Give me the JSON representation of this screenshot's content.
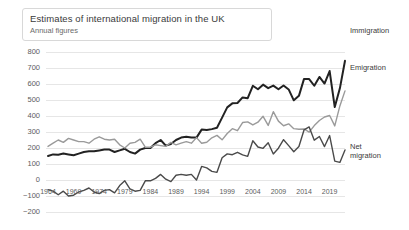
{
  "header": {
    "title": "Estimates of international migration in the UK",
    "subtitle": "Annual figures"
  },
  "chart_data": {
    "type": "line",
    "title": "Estimates of international migration in the UK",
    "subtitle": "Annual figures",
    "xlabel": "",
    "ylabel": "",
    "units": "thousands",
    "grid": true,
    "legend_position": "right-inline",
    "xlim": [
      1964,
      2022
    ],
    "ylim": [
      -200,
      800
    ],
    "yticks": [
      800,
      700,
      600,
      500,
      400,
      300,
      200,
      100,
      0,
      -100,
      -200
    ],
    "xticks": [
      1964,
      1969,
      1974,
      1979,
      1984,
      1989,
      1994,
      1999,
      2004,
      2009,
      2014,
      2019
    ],
    "x": [
      1964,
      1965,
      1966,
      1967,
      1968,
      1969,
      1970,
      1971,
      1972,
      1973,
      1974,
      1975,
      1976,
      1977,
      1978,
      1979,
      1980,
      1981,
      1982,
      1983,
      1984,
      1985,
      1986,
      1987,
      1988,
      1989,
      1990,
      1991,
      1992,
      1993,
      1994,
      1995,
      1996,
      1997,
      1998,
      1999,
      2000,
      2001,
      2002,
      2003,
      2004,
      2005,
      2006,
      2007,
      2008,
      2009,
      2010,
      2011,
      2012,
      2013,
      2014,
      2015,
      2016,
      2017,
      2018,
      2019,
      2020,
      2021,
      2022
    ],
    "series": [
      {
        "name": "Immigration",
        "color": "#222222",
        "width": 2,
        "values": [
          150,
          160,
          158,
          165,
          160,
          155,
          165,
          175,
          180,
          180,
          185,
          190,
          190,
          175,
          185,
          195,
          175,
          165,
          190,
          200,
          200,
          230,
          250,
          215,
          225,
          250,
          265,
          270,
          265,
          265,
          315,
          312,
          318,
          327,
          390,
          454,
          479,
          481,
          516,
          511,
          589,
          567,
          596,
          574,
          590,
          567,
          591,
          566,
          498,
          526,
          632,
          631,
          589,
          644,
          603,
          681,
          456,
          573,
          745
        ]
      },
      {
        "name": "Emigration",
        "color": "#9a9a9a",
        "width": 1.4,
        "values": [
          210,
          230,
          250,
          235,
          260,
          250,
          240,
          240,
          230,
          255,
          270,
          255,
          250,
          255,
          220,
          200,
          230,
          235,
          255,
          205,
          205,
          220,
          215,
          210,
          235,
          220,
          230,
          240,
          230,
          265,
          230,
          236,
          264,
          279,
          251,
          291,
          321,
          308,
          359,
          363,
          344,
          361,
          398,
          341,
          427,
          368,
          339,
          351,
          321,
          317,
          319,
          299,
          340,
          372,
          394,
          403,
          338,
          463,
          557
        ]
      },
      {
        "name": "Net migration",
        "color": "#4a4a4a",
        "width": 1.4,
        "values": [
          -60,
          -70,
          -92,
          -70,
          -100,
          -95,
          -75,
          -65,
          -50,
          -75,
          -85,
          -65,
          -60,
          -80,
          -35,
          -5,
          -55,
          -70,
          -65,
          -5,
          -5,
          10,
          35,
          5,
          -10,
          30,
          35,
          30,
          35,
          0,
          85,
          76,
          54,
          48,
          139,
          163,
          158,
          173,
          157,
          148,
          245,
          206,
          198,
          233,
          163,
          199,
          252,
          215,
          177,
          209,
          313,
          332,
          249,
          272,
          209,
          278,
          118,
          110,
          188
        ]
      }
    ],
    "annotations": []
  },
  "series_labels": [
    {
      "name": "Immigration",
      "text": "Immigration"
    },
    {
      "name": "Emigration",
      "text": "Emigration"
    },
    {
      "name": "Net migration",
      "text": "Net\nmigration"
    }
  ],
  "colors": {
    "immigration": "#222222",
    "emigration": "#9a9a9a",
    "net_migration": "#4a4a4a",
    "grid": "#e6e6e6",
    "text": "#5c5c5c",
    "background": "#ffffff"
  }
}
